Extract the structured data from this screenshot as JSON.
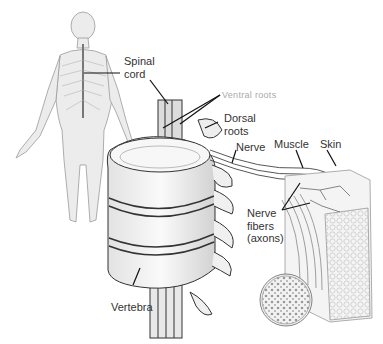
{
  "diagram": {
    "type": "anatomical-illustration",
    "colors": {
      "background": "#ffffff",
      "line": "#222222",
      "label": "#333333",
      "shading": "#bdbdbd"
    }
  },
  "labels": {
    "spinal_cord": {
      "line1": "Spinal",
      "line2": "cord"
    },
    "ventral_roots": "Ventral roots",
    "dorsal_roots": {
      "line1": "Dorsal",
      "line2": "roots"
    },
    "nerve": "Nerve",
    "muscle": "Muscle",
    "skin": "Skin",
    "nerve_fibers": {
      "line1": "Nerve",
      "line2": "fibers",
      "line3": "(axons)"
    },
    "vertebra": "Vertebra"
  }
}
